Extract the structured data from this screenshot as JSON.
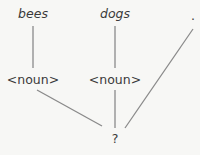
{
  "diagram": {
    "type": "parse-tree",
    "colors": {
      "line": "#8a8a8a",
      "text": "#3a3a3a",
      "background": "#f7f7f5"
    },
    "nodes": {
      "word1": {
        "label": "bees",
        "style": "italic"
      },
      "word2": {
        "label": "dogs",
        "style": "italic"
      },
      "word3": {
        "label": "."
      },
      "noun1": {
        "label": "<noun>"
      },
      "noun2": {
        "label": "<noun>"
      },
      "root": {
        "label": "?"
      }
    },
    "edges": [
      [
        "word1",
        "noun1"
      ],
      [
        "word2",
        "noun2"
      ],
      [
        "noun1",
        "root"
      ],
      [
        "noun2",
        "root"
      ],
      [
        "word3",
        "root"
      ]
    ]
  }
}
